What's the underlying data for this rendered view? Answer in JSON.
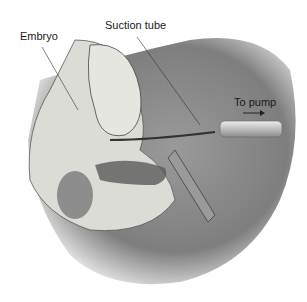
{
  "figure": {
    "labels": {
      "embryo": "Embryo",
      "suction_tube": "Suction tube",
      "to_pump": "To pump"
    },
    "colors": {
      "background": "#ffffff",
      "skin": "#8a8a8a",
      "tissue": "#d9d9d4",
      "tube": "#c8c8c8"
    }
  }
}
